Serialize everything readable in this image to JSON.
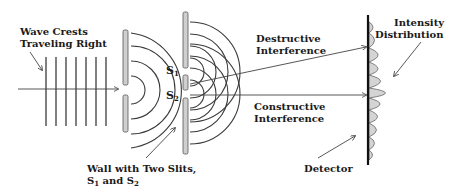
{
  "diagram": {
    "labels": {
      "wave_crests_line1": "Wave Crests",
      "wave_crests_line2": "Traveling Right",
      "wall_line1": "Wall with Two Slits,",
      "wall_line2_s1": "S",
      "wall_line2_s1_sub": "1",
      "wall_line2_and": " and S",
      "wall_line2_s2_sub": "2",
      "slit1": "S",
      "slit1_sub": "1",
      "slit2": "S",
      "slit2_sub": "2",
      "destructive_line1": "Destructive",
      "destructive_line2": "Interference",
      "constructive_line1": "Constructive",
      "constructive_line2": "Interference",
      "detector": "Detector",
      "intensity_line1": "Intensity",
      "intensity_line2": "Distribution"
    },
    "colors": {
      "ink": "#1a1a1a",
      "wall_fill": "#cfcfcf",
      "intensity_fill": "#d4d4d4"
    },
    "wave_crest_count": 7
  }
}
